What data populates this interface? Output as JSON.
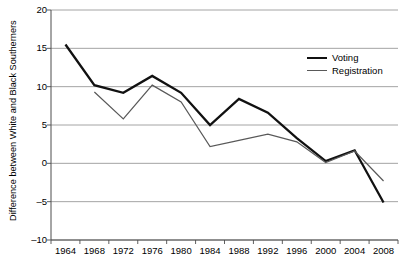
{
  "chart_data": {
    "type": "line",
    "title": "",
    "xlabel": "",
    "ylabel": "Difference between White and Black Southerners",
    "x": [
      1964,
      1968,
      1972,
      1976,
      1980,
      1984,
      1988,
      1992,
      1996,
      2000,
      2004,
      2008
    ],
    "xticklabels": [
      "1964",
      "1968",
      "1972",
      "1976",
      "1980",
      "1984",
      "1988",
      "1992",
      "1996",
      "2000",
      "2004",
      "2008"
    ],
    "yticklabels": [
      "20",
      "15",
      "10",
      "5",
      "0",
      "-5",
      "-10"
    ],
    "ytickvalues": [
      20,
      15,
      10,
      5,
      0,
      -5,
      -10
    ],
    "xlim": [
      1962,
      2010
    ],
    "ylim": [
      -10,
      20
    ],
    "grid": "horizontal",
    "legend_position": "upper-right",
    "series": [
      {
        "name": "Voting",
        "color": "#111111",
        "width": 2.3,
        "values": [
          15.5,
          10.2,
          9.2,
          11.4,
          9.2,
          5.0,
          8.4,
          6.6,
          3.3,
          0.3,
          1.7,
          -5.1
        ]
      },
      {
        "name": "Registration",
        "color": "#595959",
        "width": 1.2,
        "values": [
          null,
          9.3,
          5.8,
          10.2,
          8.0,
          2.2,
          3.0,
          3.8,
          2.8,
          0.1,
          1.6,
          -2.3
        ]
      }
    ]
  },
  "axis": {
    "y_title": "Difference between White and Black Southerners"
  },
  "legend": {
    "items": [
      {
        "label": "Voting"
      },
      {
        "label": "Registration"
      }
    ]
  }
}
